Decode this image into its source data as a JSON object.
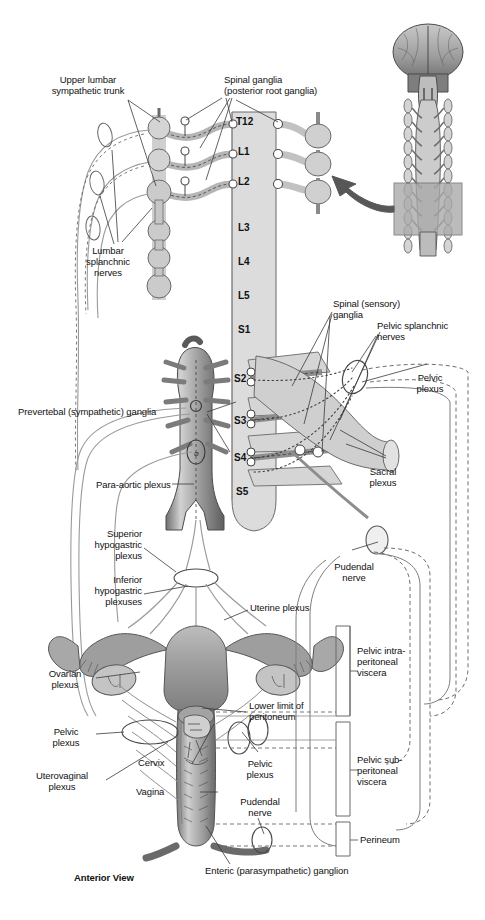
{
  "figure": {
    "view_caption": "Anterior View",
    "background": "#ffffff",
    "ink": "#1a1a1a",
    "fill_light": "#d8d8d8",
    "fill_mid": "#b5b5b5",
    "fill_dark": "#8a8a8a",
    "arrow_color": "#575757"
  },
  "vertebral_levels": [
    {
      "id": "T12",
      "label": "T12",
      "y": 122
    },
    {
      "id": "L1",
      "label": "L1",
      "y": 152
    },
    {
      "id": "L2",
      "label": "L2",
      "y": 182
    },
    {
      "id": "L3",
      "label": "L3",
      "y": 228
    },
    {
      "id": "L4",
      "label": "L4",
      "y": 262
    },
    {
      "id": "L5",
      "label": "L5",
      "y": 296
    },
    {
      "id": "S1",
      "label": "S1",
      "y": 330
    },
    {
      "id": "S2",
      "label": "S2",
      "y": 379
    },
    {
      "id": "S3",
      "label": "S3",
      "y": 421
    },
    {
      "id": "S4",
      "label": "S4",
      "y": 458
    },
    {
      "id": "S5",
      "label": "S5",
      "y": 492
    }
  ],
  "labels": [
    {
      "id": "upper-lumbar-sympathetic-trunk",
      "text": "Upper lumbar\nsympathetic trunk",
      "x": 88,
      "y": 74,
      "align": "center"
    },
    {
      "id": "spinal-ganglia-posterior-root",
      "text": "Spinal ganglia\n(posterior root ganglia)",
      "x": 224,
      "y": 74,
      "align": "left"
    },
    {
      "id": "lumbar-splanchnic-nerves",
      "text": "Lumbar\nsplanchnic\nnerves",
      "x": 108,
      "y": 250,
      "align": "center"
    },
    {
      "id": "spinal-sensory-ganglia",
      "text": "Spinal (sensory)\nganglia",
      "x": 333,
      "y": 302,
      "align": "left"
    },
    {
      "id": "pelvic-splanchnic-nerves",
      "text": "Pelvic splanchnic\nnerves",
      "x": 377,
      "y": 322,
      "align": "left"
    },
    {
      "id": "pelvic-plexus-upper",
      "text": "Pelvic\nplexus",
      "x": 430,
      "y": 378,
      "align": "center"
    },
    {
      "id": "prevertebal-sympathetic-ganglia",
      "text": "Prevertebal (sympathetic) ganglia",
      "x": 23,
      "y": 410,
      "align": "left"
    },
    {
      "id": "para-aortic-plexus",
      "text": "Para-aortic plexus",
      "x": 100,
      "y": 483,
      "align": "left"
    },
    {
      "id": "sacral-plexus",
      "text": "Sacral\nplexus",
      "x": 383,
      "y": 470,
      "align": "center"
    },
    {
      "id": "superior-hypogastric-plexus",
      "text": "Superior\nhypogastric\nplexus",
      "x": 140,
      "y": 533,
      "align": "right"
    },
    {
      "id": "inferior-hypogastric-plexuses",
      "text": "Inferior\nhypogastric\nplexuses",
      "x": 140,
      "y": 578,
      "align": "right"
    },
    {
      "id": "pudendal-nerve-upper",
      "text": "Pudendal\nnerve",
      "x": 352,
      "y": 565,
      "align": "center"
    },
    {
      "id": "uterine-plexus",
      "text": "Uterine plexus",
      "x": 250,
      "y": 606,
      "align": "left"
    },
    {
      "id": "pelvic-intraperitoneal-viscera",
      "text": "Pelvic intra-\nperitoneal\nviscera",
      "x": 357,
      "y": 650,
      "align": "left"
    },
    {
      "id": "ovarian-plexus",
      "text": "Ovarian\nplexus",
      "x": 64,
      "y": 673,
      "align": "center"
    },
    {
      "id": "lower-limit-of-peritoneum",
      "text": "Lower limit of\nperitoneum",
      "x": 249,
      "y": 705,
      "align": "left"
    },
    {
      "id": "pelvic-plexus-left",
      "text": "Pelvic\nplexus",
      "x": 64,
      "y": 730,
      "align": "center"
    },
    {
      "id": "cervix",
      "text": "Cervix",
      "x": 166,
      "y": 762,
      "align": "left"
    },
    {
      "id": "pelvic-plexus-center",
      "text": "Pelvic\nplexus",
      "x": 258,
      "y": 763,
      "align": "center"
    },
    {
      "id": "pelvic-subperitoneal-viscera",
      "text": "Pelvic sub-\nperitoneal\nviscera",
      "x": 357,
      "y": 759,
      "align": "left"
    },
    {
      "id": "uterovaginal-plexus",
      "text": "Uterovaginal\nplexus",
      "x": 62,
      "y": 775,
      "align": "center"
    },
    {
      "id": "vagina",
      "text": "Vagina",
      "x": 163,
      "y": 790,
      "align": "left"
    },
    {
      "id": "pudendal-nerve-lower",
      "text": "Pudendal\nnerve",
      "x": 258,
      "y": 800,
      "align": "center"
    },
    {
      "id": "perineum",
      "text": "Perineum",
      "x": 360,
      "y": 838,
      "align": "left"
    },
    {
      "id": "enteric-parasympathetic-ganglion",
      "text": "Enteric (parasympathetic) ganglion",
      "x": 205,
      "y": 869,
      "align": "left"
    }
  ],
  "inset": {
    "id": "brain-spinal-cord-inset",
    "description": "Brain and spinal cord orientation inset",
    "x": 375,
    "y": 12,
    "width": 105,
    "height": 245
  },
  "arrow": {
    "id": "inset-pointer-arrow",
    "description": "Arrow from inset to lumbar sympathetic chain",
    "from_x": 405,
    "from_y": 200,
    "to_x": 335,
    "to_y": 176
  }
}
